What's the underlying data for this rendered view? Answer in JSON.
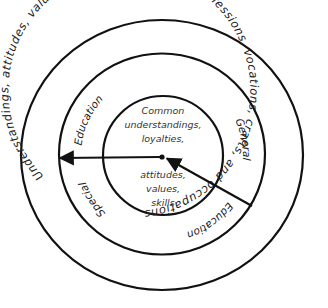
{
  "diagram": {
    "type": "concentric-circles",
    "outer_ring": {
      "text": "Understandings, attitudes, values, and skills specific to professions, vocations, crafts, and occupations"
    },
    "middle_ring": {
      "labels": [
        {
          "id": "education-upper",
          "text": "Education"
        },
        {
          "id": "general",
          "text": "General"
        },
        {
          "id": "education-lower",
          "text": "Education"
        },
        {
          "id": "special",
          "text": "Special"
        }
      ]
    },
    "inner_circle": {
      "text_top_lines": [
        "Common",
        "understandings,",
        "loyalties,"
      ],
      "text_bottom_lines": [
        "attitudes,",
        "values,",
        "skills"
      ]
    },
    "arrows": [
      {
        "id": "center-to-special",
        "direction": "from center outward to left edge of middle ring"
      },
      {
        "id": "general-to-center",
        "direction": "from lower-right on middle ring inward to center"
      }
    ],
    "colors": {
      "stroke": "#111111",
      "text": "#222222",
      "background": "#ffffff"
    }
  }
}
